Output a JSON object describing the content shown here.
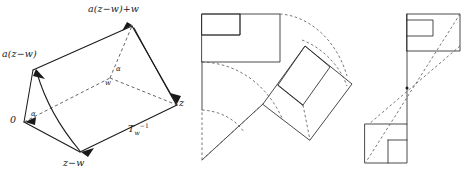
{
  "figure": {
    "title": "",
    "panels": [
      {
        "id": "left",
        "name": "prism-with-rotation-arcs",
        "labels": {
          "top_vertex": "a(z−w)+w",
          "left_vertex": "a(z−w)",
          "origin": "0",
          "bottom_vertex": "z−w",
          "right_vertex": "z",
          "center": "w",
          "angle_lower": "α",
          "angle_upper": "α",
          "map_label_base": "T",
          "map_label_sub": "w",
          "map_label_sup": "−1"
        }
      },
      {
        "id": "middle",
        "name": "rotated-rectangle-pair",
        "labels": {}
      },
      {
        "id": "right",
        "name": "point-reflected-rectangle-pair",
        "labels": {}
      }
    ],
    "colors": {
      "ink": "#1a1a1a",
      "dash": "#4a4a4a",
      "background": "#ffffff"
    }
  }
}
